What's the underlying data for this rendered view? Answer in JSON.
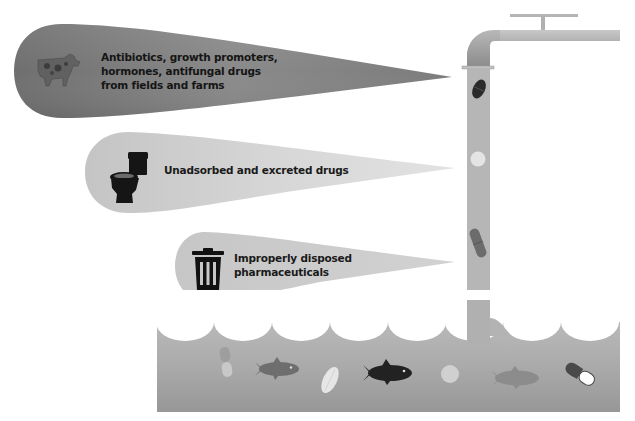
{
  "figure": {
    "type": "illustration",
    "colors": {
      "beam_dark": "#7a7a7a",
      "beam_mid": "#cfcfcf",
      "beam_light": "#cbcbcb",
      "pipe": "#b9b9b9",
      "water_top": "#b4b4b4",
      "water_bottom": "#9a9a9a",
      "icon": "#111111"
    }
  },
  "sources": [
    {
      "id": "farms",
      "icon": "cow-icon",
      "lines": [
        "Antibiotics, growth promoters,",
        "hormones, antifungal drugs",
        "from fields and farms"
      ]
    },
    {
      "id": "toilet",
      "icon": "toilet-icon",
      "lines": [
        "Unadsorbed and excreted drugs"
      ]
    },
    {
      "id": "trash",
      "icon": "trash-can-icon",
      "lines": [
        "Improperly disposed",
        "pharmaceuticals"
      ]
    }
  ],
  "faucet": {
    "items_in_pipe": [
      "dark-oval-pill",
      "white-round-tablet",
      "capsule"
    ]
  },
  "water": {
    "items": [
      "capsule",
      "fish",
      "oval-tablet",
      "fish-dark",
      "round-tablet",
      "fish",
      "capsule-red-white"
    ]
  },
  "caption": {
    "text": ""
  }
}
